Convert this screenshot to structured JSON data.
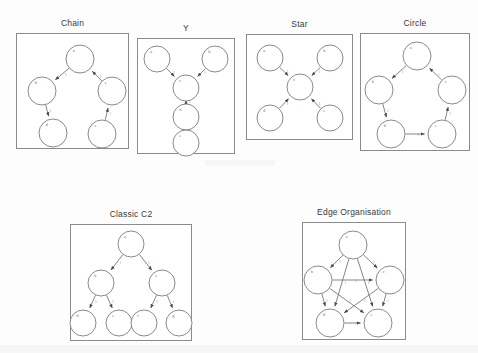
{
  "figure": {
    "background_color": "#fdfdfd",
    "node_stroke_color": "#7d7d7d",
    "edge_stroke_color": "#6f6f6f",
    "panel_border_color": "#8b8b8b"
  },
  "panels": [
    {
      "id": "chain",
      "title": "Chain",
      "box": {
        "x": 16,
        "y": 33,
        "w": 113,
        "h": 116
      },
      "nodes": [
        {
          "id": "a",
          "label": "a",
          "cx": 64,
          "cy": 26,
          "r": 14
        },
        {
          "id": "b",
          "label": "b",
          "cx": 26,
          "cy": 58,
          "r": 14
        },
        {
          "id": "c",
          "label": "c",
          "cx": 96,
          "cy": 58,
          "r": 14
        },
        {
          "id": "d",
          "label": "d",
          "cx": 37,
          "cy": 100,
          "r": 14
        },
        {
          "id": "e",
          "label": "e",
          "cx": 86,
          "cy": 101,
          "r": 14
        }
      ],
      "edges": [
        {
          "from": "a",
          "to": "b",
          "label": "1"
        },
        {
          "from": "b",
          "to": "d",
          "label": "1"
        },
        {
          "from": "c",
          "to": "a",
          "label": "1"
        },
        {
          "from": "e",
          "to": "c",
          "label": "1"
        }
      ]
    },
    {
      "id": "y",
      "title": "Y",
      "box": {
        "x": 137,
        "y": 38,
        "w": 98,
        "h": 116
      },
      "nodes": [
        {
          "id": "a",
          "label": "a",
          "cx": 20,
          "cy": 21,
          "r": 13
        },
        {
          "id": "b",
          "label": "b",
          "cx": 78,
          "cy": 21,
          "r": 13
        },
        {
          "id": "c",
          "label": "c",
          "cx": 49,
          "cy": 50,
          "r": 13
        },
        {
          "id": "d",
          "label": "d",
          "cx": 49,
          "cy": 79,
          "r": 13
        },
        {
          "id": "e",
          "label": "e",
          "cx": 49,
          "cy": 105,
          "r": 13
        }
      ],
      "edges": [
        {
          "from": "a",
          "to": "c",
          "label": "1"
        },
        {
          "from": "b",
          "to": "c",
          "label": "1"
        },
        {
          "from": "c",
          "to": "d",
          "label": "1"
        },
        {
          "from": "d",
          "to": "e",
          "label": "1"
        }
      ]
    },
    {
      "id": "star",
      "title": "Star",
      "box": {
        "x": 246,
        "y": 34,
        "w": 107,
        "h": 106
      },
      "nodes": [
        {
          "id": "a",
          "label": "a",
          "cx": 24,
          "cy": 24,
          "r": 13
        },
        {
          "id": "b",
          "label": "b",
          "cx": 84,
          "cy": 24,
          "r": 13
        },
        {
          "id": "c",
          "label": "c",
          "cx": 54,
          "cy": 53,
          "r": 13
        },
        {
          "id": "d",
          "label": "d",
          "cx": 24,
          "cy": 84,
          "r": 13
        },
        {
          "id": "e",
          "label": "e",
          "cx": 84,
          "cy": 84,
          "r": 13
        }
      ],
      "edges": [
        {
          "from": "a",
          "to": "c",
          "label": "1"
        },
        {
          "from": "b",
          "to": "c",
          "label": "1"
        },
        {
          "from": "d",
          "to": "c",
          "label": "1"
        },
        {
          "from": "e",
          "to": "c",
          "label": "1"
        }
      ]
    },
    {
      "id": "circle",
      "title": "Circle",
      "box": {
        "x": 360,
        "y": 33,
        "w": 110,
        "h": 118
      },
      "nodes": [
        {
          "id": "a",
          "label": "a",
          "cx": 57,
          "cy": 23,
          "r": 14
        },
        {
          "id": "b",
          "label": "b",
          "cx": 19,
          "cy": 57,
          "r": 14
        },
        {
          "id": "c",
          "label": "c",
          "cx": 92,
          "cy": 57,
          "r": 14
        },
        {
          "id": "d",
          "label": "d",
          "cx": 31,
          "cy": 101,
          "r": 14
        },
        {
          "id": "e",
          "label": "e",
          "cx": 82,
          "cy": 101,
          "r": 14
        }
      ],
      "edges": [
        {
          "from": "a",
          "to": "b",
          "label": "1"
        },
        {
          "from": "b",
          "to": "d",
          "label": "1"
        },
        {
          "from": "d",
          "to": "e",
          "label": "1"
        },
        {
          "from": "e",
          "to": "c",
          "label": "1"
        },
        {
          "from": "c",
          "to": "a",
          "label": "1"
        }
      ]
    },
    {
      "id": "classic-c2",
      "title": "Classic C2",
      "box": {
        "x": 70,
        "y": 224,
        "w": 122,
        "h": 117
      },
      "nodes": [
        {
          "id": "a",
          "label": "a",
          "cx": 61,
          "cy": 20,
          "r": 13
        },
        {
          "id": "b",
          "label": "b",
          "cx": 31,
          "cy": 59,
          "r": 13
        },
        {
          "id": "c",
          "label": "c",
          "cx": 92,
          "cy": 59,
          "r": 13
        },
        {
          "id": "d",
          "label": "d",
          "cx": 13,
          "cy": 99,
          "r": 13
        },
        {
          "id": "e",
          "label": "e",
          "cx": 49,
          "cy": 99,
          "r": 13
        },
        {
          "id": "f",
          "label": "f",
          "cx": 74,
          "cy": 99,
          "r": 13
        },
        {
          "id": "g",
          "label": "g",
          "cx": 109,
          "cy": 99,
          "r": 13
        }
      ],
      "edges": [
        {
          "from": "a",
          "to": "b",
          "label": "1"
        },
        {
          "from": "a",
          "to": "c",
          "label": "1"
        },
        {
          "from": "b",
          "to": "d",
          "label": "1"
        },
        {
          "from": "b",
          "to": "e",
          "label": "1"
        },
        {
          "from": "c",
          "to": "f",
          "label": "1"
        },
        {
          "from": "c",
          "to": "g",
          "label": "1"
        }
      ]
    },
    {
      "id": "edge-organisation",
      "title": "Edge Organisation",
      "box": {
        "x": 302,
        "y": 222,
        "w": 104,
        "h": 118
      },
      "nodes": [
        {
          "id": "a",
          "label": "a",
          "cx": 51,
          "cy": 23,
          "r": 14
        },
        {
          "id": "b",
          "label": "b",
          "cx": 16,
          "cy": 58,
          "r": 14
        },
        {
          "id": "c",
          "label": "c",
          "cx": 88,
          "cy": 58,
          "r": 14
        },
        {
          "id": "d",
          "label": "d",
          "cx": 28,
          "cy": 101,
          "r": 14
        },
        {
          "id": "e",
          "label": "e",
          "cx": 76,
          "cy": 101,
          "r": 14
        }
      ],
      "edges": [
        {
          "from": "a",
          "to": "b",
          "label": "1"
        },
        {
          "from": "a",
          "to": "c",
          "label": "1"
        },
        {
          "from": "a",
          "to": "d",
          "label": "1"
        },
        {
          "from": "a",
          "to": "e",
          "label": "1"
        },
        {
          "from": "b",
          "to": "c",
          "label": "1"
        },
        {
          "from": "b",
          "to": "d",
          "label": "1"
        },
        {
          "from": "b",
          "to": "e",
          "label": "1"
        },
        {
          "from": "c",
          "to": "d",
          "label": "1"
        },
        {
          "from": "c",
          "to": "e",
          "label": "1"
        },
        {
          "from": "d",
          "to": "e",
          "label": "1"
        }
      ]
    }
  ]
}
